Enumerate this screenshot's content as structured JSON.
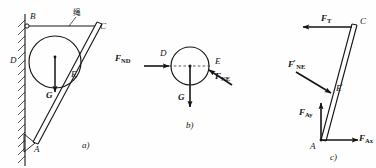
{
  "figure": {
    "background": "#fefefe",
    "ink": "#141414"
  },
  "panel_a": {
    "caption": "a)",
    "annotation_cjk": "绳",
    "points": {
      "A": "A",
      "B": "B",
      "C": "C",
      "D": "D",
      "E": "E"
    },
    "forces": {
      "weight": "G"
    }
  },
  "panel_b": {
    "caption": "b)",
    "points": {
      "D": "D",
      "E": "E"
    },
    "forces": {
      "normal_wall": "F",
      "normal_wall_sub": "ND",
      "normal_rod": "F",
      "normal_rod_sub": "NE",
      "weight": "G"
    }
  },
  "panel_c": {
    "caption": "c)",
    "points": {
      "A": "A",
      "C": "C",
      "E_prime": "E",
      "E_prime_mark": "′"
    },
    "forces": {
      "rope_tension": "F",
      "rope_tension_sub": "T",
      "reaction_NE": "F",
      "reaction_NE_mark": "′",
      "reaction_NE_sub": "NE",
      "pin_y": "F",
      "pin_y_sub": "Ay",
      "pin_x": "F",
      "pin_x_sub": "Ax"
    }
  }
}
